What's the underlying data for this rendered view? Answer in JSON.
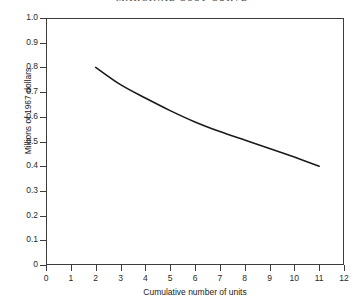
{
  "chart_data": {
    "type": "line",
    "title": "MARGINAL COST CURVE",
    "xlabel": "Cumulative number of units",
    "ylabel": "Millions of 1967 dollars",
    "xlim": [
      0,
      12
    ],
    "ylim": [
      0,
      1.0
    ],
    "grid": false,
    "legend": null,
    "xticks": [
      "0",
      "1",
      "2",
      "3",
      "4",
      "5",
      "6",
      "7",
      "8",
      "9",
      "10",
      "11",
      "12"
    ],
    "xtick_values": [
      0,
      1,
      2,
      3,
      4,
      5,
      6,
      7,
      8,
      9,
      10,
      11,
      12
    ],
    "yticks": [
      "0",
      "0.1",
      "0.2",
      "0.3",
      "0.4",
      "0.5",
      "0.6",
      "0.7",
      "0.8",
      "0.9",
      "1.0"
    ],
    "ytick_values": [
      0,
      0.1,
      0.2,
      0.3,
      0.4,
      0.5,
      0.6,
      0.7,
      0.8,
      0.9,
      1.0
    ],
    "series": [
      {
        "name": "Marginal cost",
        "x": [
          2,
          3,
          4,
          5,
          6,
          7,
          8,
          9,
          10,
          11
        ],
        "values": [
          0.8,
          0.73,
          0.676,
          0.625,
          0.579,
          0.54,
          0.506,
          0.472,
          0.437,
          0.4
        ]
      }
    ],
    "line_color": "#1a1a1a",
    "frame_color": "#3c3c3c",
    "background": "#ffffff"
  }
}
